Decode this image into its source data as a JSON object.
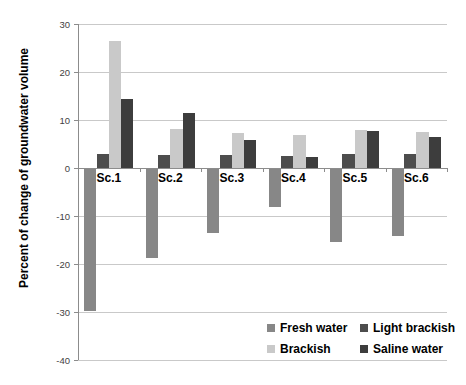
{
  "chart_data": {
    "type": "bar",
    "title": "",
    "xlabel": "",
    "ylabel": "Percent of change of groundwater volume",
    "categories": [
      "Sc.1",
      "Sc.2",
      "Sc.3",
      "Sc.4",
      "Sc.5",
      "Sc.6"
    ],
    "series": [
      {
        "name": "Fresh water",
        "color": "#878787",
        "values": [
          -29.8,
          -18.8,
          -13.5,
          -8.1,
          -15.5,
          -14.2
        ]
      },
      {
        "name": "Light brackish",
        "color": "#4d4d4d",
        "values": [
          3.0,
          2.8,
          2.8,
          2.5,
          3.0,
          2.9
        ]
      },
      {
        "name": "Brackish",
        "color": "#c9c9c9",
        "values": [
          26.4,
          8.2,
          7.4,
          6.9,
          7.9,
          7.6
        ]
      },
      {
        "name": "Saline water",
        "color": "#3d3d3d",
        "values": [
          14.3,
          11.5,
          5.8,
          2.3,
          7.8,
          6.5
        ]
      }
    ],
    "ylim": [
      -40,
      30
    ],
    "yticks": [
      30,
      20,
      10,
      0,
      -10,
      -20,
      -30,
      -40
    ],
    "grid": true,
    "legend_position": "inside-bottom-right",
    "colors": {
      "gridline": "#c9c9c9",
      "axis_line": "#8c8c8c",
      "tick_label": "#3f3f3f",
      "text": "#000000",
      "background": "#ffffff"
    }
  }
}
